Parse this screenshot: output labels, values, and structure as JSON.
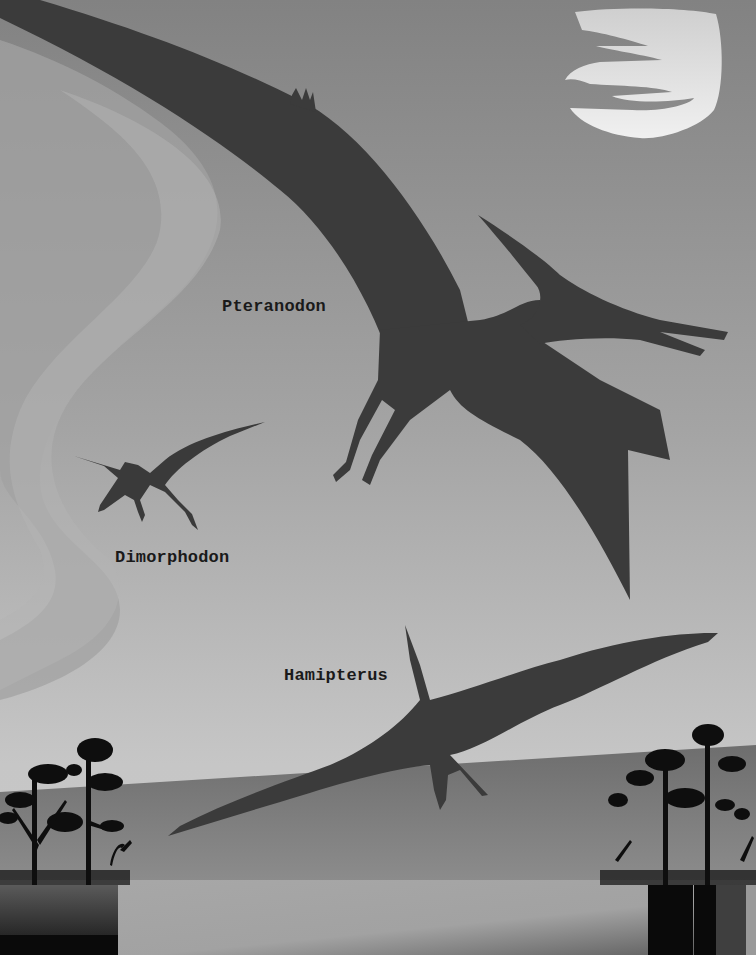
{
  "scene": {
    "labels": {
      "pteranodon": "Pteranodon",
      "dimorphodon": "Dimorphodon",
      "hamipterus": "Hamipterus"
    },
    "colors": {
      "sky_top": "#858585",
      "sky_bottom": "#c4c4c4",
      "swirl": "#acacac",
      "moon": "#e6e6e6",
      "silhouette": "#3a3a3a",
      "ground": "#7a7a7a",
      "trees": "#0d0d0d",
      "foreground": "#a6a6a6"
    },
    "elements": [
      "moon",
      "pteranodon",
      "dimorphodon",
      "hamipterus",
      "tree-cluster-left",
      "tree-cluster-right",
      "ground-hill"
    ]
  }
}
